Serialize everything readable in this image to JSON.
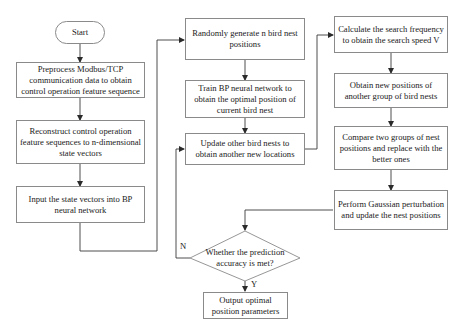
{
  "diagram": {
    "nodes": {
      "start": "Start",
      "preprocess": "Preprocess Modbus/TCP communication data to obtain control operation feature sequence",
      "reconstruct": "Reconstruct control operation feature sequences to n-dimensional state vectors",
      "input": "Input the state vectors into BP neural network",
      "random": "Randomly generate n bird nest positions",
      "train": "Train BP neural network to obtain the optimal position of current bird nest",
      "update": "Update other bird nests to obtain another new locations",
      "calculate": "Calculate the search frequency to obtain the search speed V",
      "obtain": "Obtain new positions of another group of bird nests",
      "compare": "Compare two groups of nest positions and replace with the better ones",
      "gaussian": "Perform Gaussian perturbation and update the nest positions",
      "decision": "Whether the prediction accuracy is met?",
      "output": "Output optimal position parameters"
    },
    "edge_labels": {
      "no": "N",
      "yes": "Y"
    },
    "colors": {
      "line": "#3a3a3a",
      "border": "#8a8a8a",
      "text": "#1a1a1a"
    }
  }
}
